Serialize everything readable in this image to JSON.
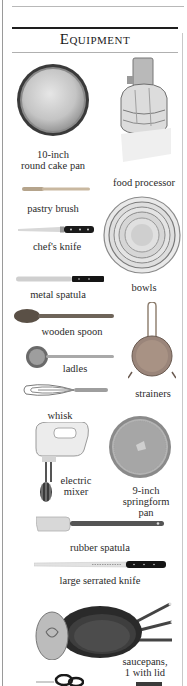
{
  "page": {
    "title": "Equipment"
  },
  "items": [
    {
      "label": "10-inch",
      "label2": "round cake pan",
      "icon": "cake-pan-icon"
    },
    {
      "label": "food processor",
      "icon": "food-processor-icon"
    },
    {
      "label": "pastry brush",
      "icon": "pastry-brush-icon"
    },
    {
      "label": "chef's knife",
      "icon": "chefs-knife-icon"
    },
    {
      "label": "bowls",
      "icon": "bowls-icon"
    },
    {
      "label": "metal spatula",
      "icon": "metal-spatula-icon"
    },
    {
      "label": "wooden spoon",
      "icon": "wooden-spoon-icon"
    },
    {
      "label": "ladles",
      "icon": "ladle-icon"
    },
    {
      "label": "strainers",
      "icon": "strainer-icon"
    },
    {
      "label": "whisk",
      "icon": "whisk-icon"
    },
    {
      "label": "electric",
      "label2": "mixer",
      "icon": "electric-mixer-icon"
    },
    {
      "label": "9-inch",
      "label2": "springform",
      "label3": "pan",
      "icon": "springform-pan-icon"
    },
    {
      "label": "rubber spatula",
      "icon": "rubber-spatula-icon"
    },
    {
      "label": "large serrated knife",
      "icon": "serrated-knife-icon"
    },
    {
      "label": "saucepans,",
      "label2": "1 with lid",
      "icon": "saucepans-icon"
    },
    {
      "label": "",
      "icon": "kitchen-scissors-icon"
    }
  ]
}
